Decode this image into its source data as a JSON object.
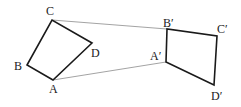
{
  "diagram": {
    "type": "geometric-transformation",
    "original": {
      "name": "ABCD",
      "vertices": {
        "A": {
          "label": "A",
          "x": 53,
          "y": 80
        },
        "B": {
          "label": "B",
          "x": 27,
          "y": 65
        },
        "C": {
          "label": "C",
          "x": 52,
          "y": 20
        },
        "D": {
          "label": "D",
          "x": 92,
          "y": 43
        }
      }
    },
    "image": {
      "name": "A'B'C'D'",
      "vertices": {
        "A": {
          "label": "A′",
          "x": 166,
          "y": 62
        },
        "B": {
          "label": "B′",
          "x": 167,
          "y": 29
        },
        "C": {
          "label": "C′",
          "x": 217,
          "y": 36
        },
        "D": {
          "label": "D′",
          "x": 214,
          "y": 85
        }
      }
    },
    "connectors": [
      {
        "from": "C",
        "to": "B′"
      },
      {
        "from": "A",
        "to": "A′"
      }
    ],
    "colors": {
      "edge": "#1a1a1a",
      "connector": "#8c8c8c",
      "background": "#ffffff"
    }
  }
}
